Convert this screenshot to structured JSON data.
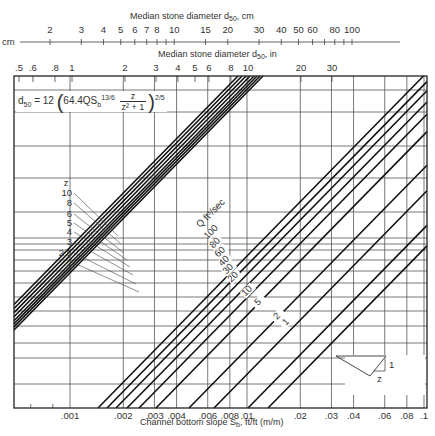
{
  "chart_data": {
    "type": "line",
    "title": "",
    "xlabel": "Channel bottom slope S_b, ft/ft (m/m)",
    "ylabel": "",
    "top_axis_inches_label": "Median stone diameter d50, in",
    "top_axis_cm_label": "Median stone diameter d50, cm",
    "cm_axis_unit": "cm",
    "x_scale": "log",
    "x_range": [
      0.0005,
      0.1
    ],
    "x_ticks": [
      ".001",
      ".002",
      ".003",
      ".004",
      ".006",
      ".008",
      ".01",
      ".02",
      ".03",
      ".04",
      ".06",
      ".08",
      ".1"
    ],
    "inch_ticks": [
      ".5",
      ".6",
      ".8",
      "1",
      "2",
      "3",
      "4",
      "5",
      "6",
      "8",
      "10",
      "20",
      "30"
    ],
    "cm_ticks": [
      "2",
      "3",
      "4",
      "5",
      "6",
      "7",
      "8",
      "10",
      "15",
      "20",
      "30",
      "40",
      "50",
      "60",
      "80",
      "100"
    ],
    "equation": "d50 = 12 (64.4 Q S_b^(13/6) · z/(z^2 + 1))^(2/5)",
    "z_lines": {
      "label": "z",
      "values": [
        "10",
        "8",
        "6",
        "5",
        "4",
        "3",
        "2.5",
        "2"
      ]
    },
    "q_lines": {
      "label": "Q ft³/sec",
      "values": [
        "100",
        "80",
        "60",
        "40",
        "30",
        "20",
        "10",
        "5",
        "2",
        "1"
      ]
    },
    "inset": {
      "description": "V-shaped channel cross-section",
      "slope_labels": [
        "1",
        "z"
      ]
    },
    "grid": true,
    "legend": "none"
  },
  "labels": {
    "cm_unit": "cm",
    "cm_axis_title": "Median stone diameter d",
    "cm_axis_title_sub": "50",
    "cm_axis_title_suffix": ", cm",
    "in_axis_title": "Median stone diameter d",
    "in_axis_title_sub": "50",
    "in_axis_title_suffix": ", in",
    "x_axis_title_prefix": "Channel bottom slope S",
    "x_axis_title_sub": "b",
    "x_axis_title_suffix": ", ft/ft (m/m)",
    "eq_lhs": "d",
    "eq_lhs_sub": "50",
    "eq_equals": " = 12",
    "eq_inner": "64.4QS",
    "eq_inner_sub": "b",
    "eq_inner_sup": "13/6",
    "eq_num": "z",
    "eq_den": "z² + 1",
    "eq_power": "2/5",
    "z_title": "z",
    "q_title": "Q ft³/sec",
    "inset_one": "1",
    "inset_z": "z"
  }
}
